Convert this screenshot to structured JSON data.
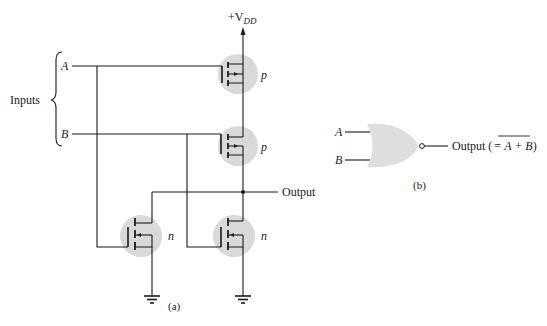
{
  "diagram": {
    "type": "circuit",
    "colors": {
      "wire": "#1a1a1a",
      "transistor_highlight": "#d9d9d9",
      "gate_fill": "#dedede",
      "text": "#222222"
    },
    "part_a": {
      "caption": "(a)",
      "supply_label": "+V",
      "supply_subscript": "DD",
      "inputs_label": "Inputs",
      "input_a": "A",
      "input_b": "B",
      "output_label": "Output",
      "transistors": [
        {
          "id": "p-top",
          "type": "p",
          "label": "p",
          "gate": "A"
        },
        {
          "id": "p-bottom",
          "type": "p",
          "label": "p",
          "gate": "B"
        },
        {
          "id": "n-left",
          "type": "n",
          "label": "n",
          "gate": "A"
        },
        {
          "id": "n-right",
          "type": "n",
          "label": "n",
          "gate": "B"
        }
      ],
      "grounds": 2
    },
    "part_b": {
      "caption": "(b)",
      "input_a": "A",
      "input_b": "B",
      "gate_symbol": "NOR",
      "output_prefix": "Output (",
      "output_equals": "=",
      "output_expr": "A + B",
      "output_suffix": ")"
    }
  }
}
